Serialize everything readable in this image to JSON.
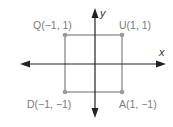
{
  "diagram": {
    "type": "coordinate-plane-square",
    "axes": {
      "x_label": "x",
      "y_label": "y"
    },
    "points": [
      {
        "name": "Q",
        "label": "Q(−1, 1)",
        "x": -1,
        "y": 1
      },
      {
        "name": "U",
        "label": "U(1, 1)",
        "x": 1,
        "y": 1
      },
      {
        "name": "D",
        "label": "D(−1, −1)",
        "x": -1,
        "y": -1
      },
      {
        "name": "A",
        "label": "A(1, −1)",
        "x": 1,
        "y": -1
      }
    ],
    "colors": {
      "axis": "#222222",
      "square": "#8a8a8a",
      "point": "#9a9a9a",
      "label": "#7a7a7a"
    }
  }
}
